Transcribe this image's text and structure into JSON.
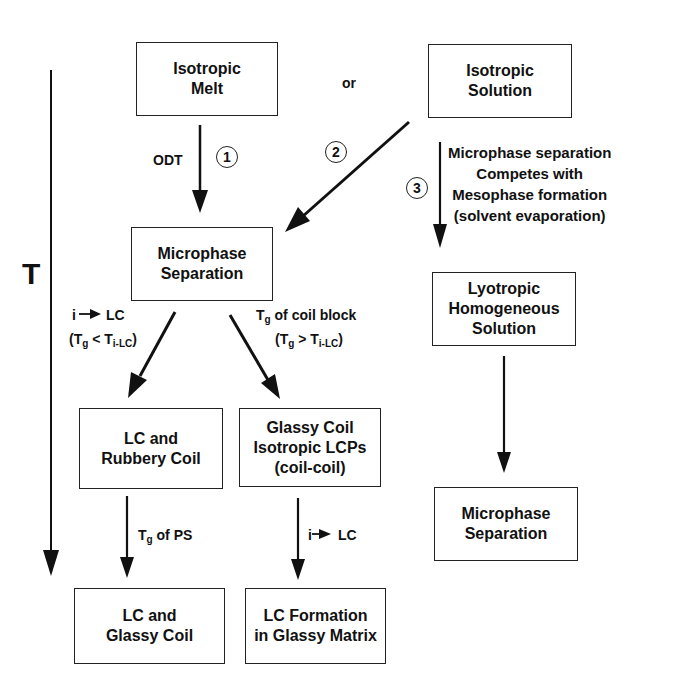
{
  "axis": {
    "label": "T",
    "direction": "decreasing downward"
  },
  "connector_or": "or",
  "boxes": {
    "isotropic_melt": [
      "Isotropic",
      "Melt"
    ],
    "isotropic_solution": [
      "Isotropic",
      "Solution"
    ],
    "microphase_separation": [
      "Microphase",
      "Separation"
    ],
    "lc_rubbery_coil": [
      "LC and",
      "Rubbery Coil"
    ],
    "glassy_coil_isotropic": [
      "Glassy Coil",
      "Isotropic LCPs",
      "(coil-coil)"
    ],
    "lc_glassy_coil": [
      "LC and",
      "Glassy Coil"
    ],
    "lc_formation": [
      "LC Formation",
      "in Glassy Matrix"
    ],
    "lyotropic": [
      "Lyotropic",
      "Homogeneous",
      "Solution"
    ],
    "microphase_separation_right": [
      "Microphase",
      "Separation"
    ]
  },
  "paths": {
    "p1": {
      "number": "1",
      "label": "ODT"
    },
    "p2": {
      "number": "2"
    },
    "p3": {
      "number": "3",
      "label": [
        "Microphase separation",
        "Competes with",
        "Mesophase formation",
        "(solvent evaporation)"
      ]
    }
  },
  "edge_labels": {
    "left_branch": {
      "line1_pre": "i",
      "line1_post": "LC",
      "line2_open": "(T",
      "line2_sub1": "g",
      "line2_mid": " < T",
      "line2_sub2": "i-LC",
      "line2_close": ")"
    },
    "right_branch": {
      "line1_T": "T",
      "line1_sub": "g",
      "line1_rest": " of coil block",
      "line2_open": "(T",
      "line2_sub1": "g",
      "line2_mid": " > T",
      "line2_sub2": "i-LC",
      "line2_close": ")"
    },
    "tg_ps": {
      "T": "T",
      "sub": "g",
      "rest": " of PS"
    },
    "i_lc": {
      "pre": "i",
      "post": "LC"
    }
  }
}
